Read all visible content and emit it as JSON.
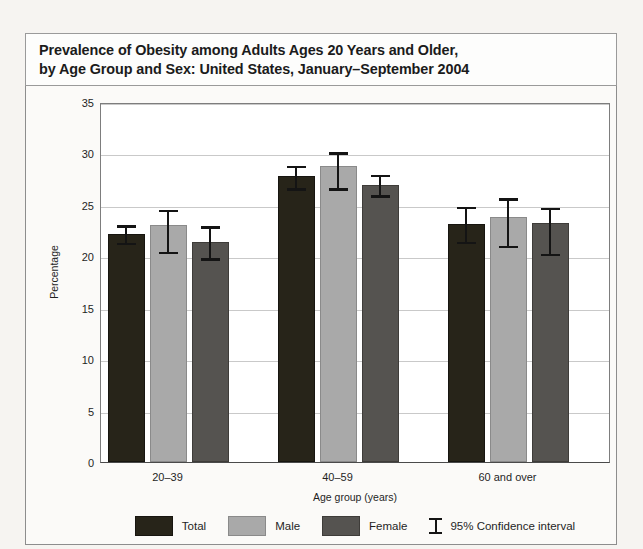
{
  "figure": {
    "title_line1": "Prevalence of Obesity among Adults Ages 20 Years and Older,",
    "title_line2": "by Age Group and Sex: United States, January–September 2004"
  },
  "chart_data": {
    "type": "bar",
    "title": "Prevalence of Obesity among Adults Ages 20 Years and Older, by Age Group and Sex: United States, January–September 2004",
    "xlabel": "Age group (years)",
    "ylabel": "Percentage",
    "ylim": [
      0,
      35
    ],
    "yticks": [
      0,
      5,
      10,
      15,
      20,
      25,
      30,
      35
    ],
    "grid": true,
    "legend_position": "bottom",
    "categories": [
      "20–39",
      "40–59",
      "60 and over"
    ],
    "series": [
      {
        "name": "Total",
        "color": "#272419",
        "values": [
          22.2,
          27.8,
          23.1
        ],
        "ci_low": [
          21.4,
          26.7,
          21.5
        ],
        "ci_high": [
          23.1,
          28.9,
          24.9
        ]
      },
      {
        "name": "Male",
        "color": "#a9a9a9",
        "values": [
          23.0,
          28.8,
          23.8
        ],
        "ci_low": [
          20.5,
          26.7,
          21.1
        ],
        "ci_high": [
          24.6,
          30.2,
          25.7
        ]
      },
      {
        "name": "Female",
        "color": "#555350",
        "values": [
          21.4,
          26.9,
          23.2
        ],
        "ci_low": [
          19.9,
          26.0,
          20.3
        ],
        "ci_high": [
          23.0,
          28.0,
          24.8
        ]
      }
    ],
    "error_legend": "95% Confidence interval"
  }
}
